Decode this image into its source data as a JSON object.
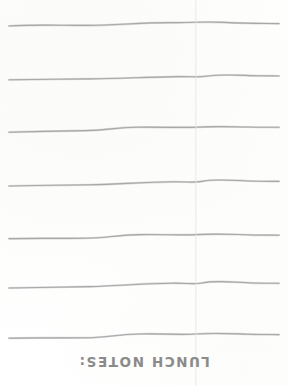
{
  "page": {
    "width": 288,
    "height": 386,
    "background_color": "#fefefe"
  },
  "caption": {
    "text": "LUNCH NOTES:",
    "color": "#8b8b8b",
    "rotation_degrees": 180,
    "orientation": "upside-down",
    "center_x": 144,
    "baseline_y": 374
  },
  "fold": {
    "name": "vertical-fold-crease",
    "x": 196,
    "color": "#dedee0"
  },
  "rules": {
    "count": 7,
    "color": "#a8a8a8",
    "stroke_width": 1.15,
    "start_x": 9,
    "end_x": 279,
    "baselines_y": [
      24,
      78,
      130,
      184,
      237,
      286,
      336
    ],
    "paths": [
      "M 9 26 C 40 24.2, 62 25.6, 88 25.4 C 120 25.2, 140 22.4, 176 22.6 C 196 22.7, 204 21.3, 224 22.4 C 248 23.6, 262 23.4, 279 23.6",
      "M 9 79.8 C 38 79.4, 62 79.2, 90 78.9 C 122 78.5, 148 76.9, 178 76.6 C 192 76.5, 198 77.4, 206 76.2 C 224 73.8, 240 75.4, 258 75.8 C 268 76.0, 274 75.9, 279 76.0",
      "M 9 132.2 C 36 131.6, 58 131.0, 86 130.6 C 108 130.3, 114 127.6, 136 127.2 C 162 126.8, 182 128.0, 196 127.2 C 212 126.3, 226 126.6, 246 127.0 C 262 127.3, 272 127.2, 279 127.3",
      "M 9 186.0 C 36 185.4, 62 185.2, 90 184.8 C 118 184.4, 140 182.2, 172 181.8 C 188 181.6, 194 183.0, 202 181.4 C 216 178.6, 230 180.3, 248 181.0 C 262 181.5, 272 181.4, 279 181.4",
      "M 9 238.6 C 36 238.0, 58 238.6, 86 238.2 C 108 237.9, 116 235.0, 140 234.6 C 164 234.2, 180 235.6, 196 234.6 C 214 233.4, 228 234.2, 248 234.8 C 262 235.2, 272 235.1, 279 235.2",
      "M 9 288.0 C 38 287.4, 62 287.2, 90 286.6 C 118 286.0, 140 283.6, 172 283.2 C 188 283.0, 194 284.6, 202 283.0 C 216 280.2, 230 282.0, 248 282.8 C 262 283.3, 272 283.2, 279 283.3",
      "M 9 338.2 C 36 337.6, 58 338.2, 86 337.8 C 108 337.5, 116 334.4, 140 334.0 C 164 333.6, 180 335.0, 196 334.0 C 214 332.8, 228 333.6, 248 334.2 C 262 334.6, 272 334.5, 279 334.6"
    ]
  }
}
